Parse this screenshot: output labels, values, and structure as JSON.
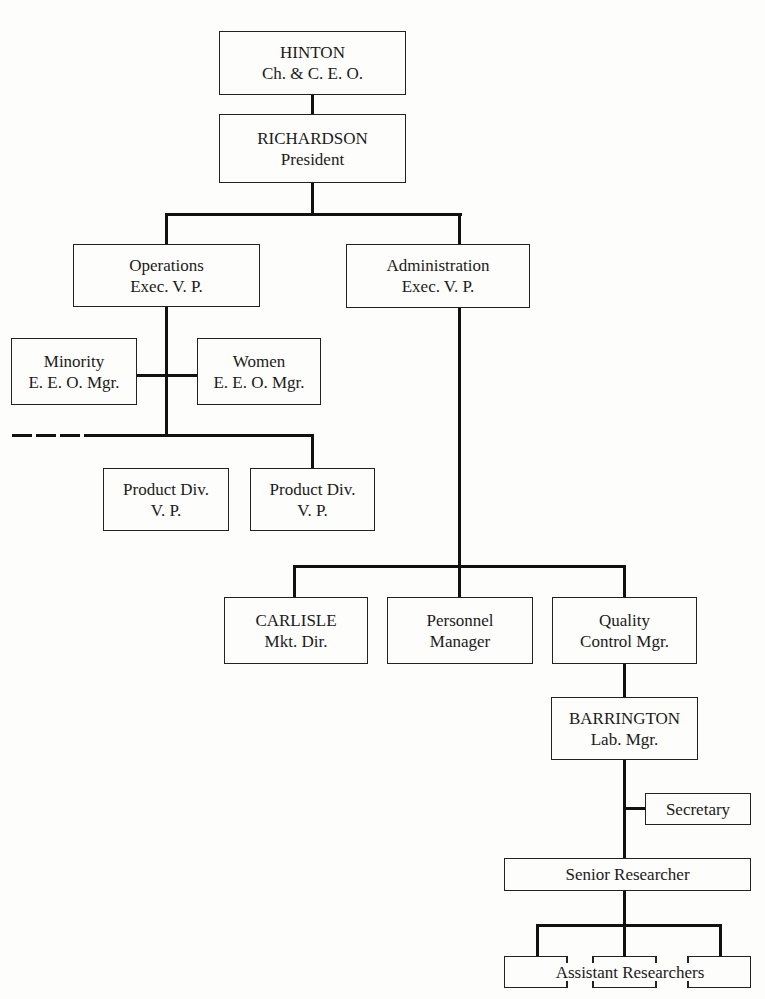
{
  "diagram": {
    "type": "organization-chart",
    "nodes": {
      "ceo": {
        "name": "HINTON",
        "title": "Ch. & C. E. O."
      },
      "president": {
        "name": "RICHARDSON",
        "title": "President"
      },
      "operations": {
        "name": "Operations",
        "title": "Exec. V. P."
      },
      "administration": {
        "name": "Administration",
        "title": "Exec. V. P."
      },
      "minority_eeo": {
        "name": "Minority",
        "title": "E. E. O. Mgr."
      },
      "women_eeo": {
        "name": "Women",
        "title": "E. E. O. Mgr."
      },
      "product_div_1": {
        "name": "Product Div.",
        "title": "V. P."
      },
      "product_div_2": {
        "name": "Product Div.",
        "title": "V. P."
      },
      "carlisle": {
        "name": "CARLISLE",
        "title": "Mkt. Dir."
      },
      "personnel": {
        "name": "Personnel",
        "title": "Manager"
      },
      "quality": {
        "name": "Quality",
        "title": "Control Mgr."
      },
      "barrington": {
        "name": "BARRINGTON",
        "title": "Lab. Mgr."
      },
      "secretary": {
        "name": "Secretary"
      },
      "senior_researcher": {
        "name": "Senior Researcher"
      },
      "assistant_researchers": {
        "name": "Assistant Researchers",
        "count_boxes": 3
      }
    },
    "edges": [
      [
        "HINTON",
        "RICHARDSON"
      ],
      [
        "RICHARDSON",
        "Operations Exec. V. P."
      ],
      [
        "RICHARDSON",
        "Administration Exec. V. P."
      ],
      [
        "Operations Exec. V. P.",
        "Minority E. E. O. Mgr."
      ],
      [
        "Operations Exec. V. P.",
        "Women E. E. O. Mgr."
      ],
      [
        "Operations Exec. V. P.",
        "Product Div. V. P. (1)"
      ],
      [
        "Operations Exec. V. P.",
        "Product Div. V. P. (2)"
      ],
      [
        "Operations Exec. V. P.",
        "(dashed: additional divisions)"
      ],
      [
        "Administration Exec. V. P.",
        "CARLISLE"
      ],
      [
        "Administration Exec. V. P.",
        "Personnel Manager"
      ],
      [
        "Administration Exec. V. P.",
        "Quality Control Mgr."
      ],
      [
        "Quality Control Mgr.",
        "BARRINGTON"
      ],
      [
        "BARRINGTON",
        "Secretary"
      ],
      [
        "BARRINGTON",
        "Senior Researcher"
      ],
      [
        "Senior Researcher",
        "Assistant Researchers"
      ]
    ]
  }
}
